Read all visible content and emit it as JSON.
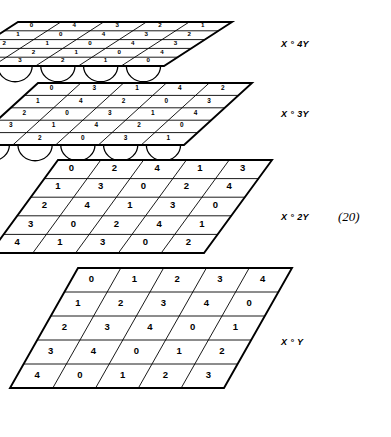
{
  "figure": {
    "equation_number": "(20)",
    "modulus": 5,
    "grid_size": 5,
    "layers": [
      {
        "label": "X ° 4Y",
        "label_id": "x-4y",
        "multiplier": 4,
        "has_support_arcs": true,
        "support_arc_count": 5,
        "rows": [
          [
            0,
            4,
            3,
            2,
            1
          ],
          [
            1,
            0,
            4,
            3,
            2
          ],
          [
            2,
            1,
            0,
            4,
            3
          ],
          [
            3,
            2,
            1,
            0,
            4
          ],
          [
            4,
            3,
            2,
            1,
            0
          ]
        ]
      },
      {
        "label": "X ° 3Y",
        "label_id": "x-3y",
        "multiplier": 3,
        "has_support_arcs": true,
        "support_arc_count": 5,
        "rows": [
          [
            0,
            3,
            1,
            4,
            2
          ],
          [
            1,
            4,
            2,
            0,
            3
          ],
          [
            2,
            0,
            3,
            1,
            4
          ],
          [
            3,
            1,
            4,
            2,
            0
          ],
          [
            4,
            2,
            0,
            3,
            1
          ]
        ]
      },
      {
        "label": "X ° 2Y",
        "label_id": "x-2y",
        "multiplier": 2,
        "has_support_arcs": false,
        "support_arc_count": 0,
        "rows": [
          [
            0,
            2,
            4,
            1,
            3
          ],
          [
            1,
            3,
            0,
            2,
            4
          ],
          [
            2,
            4,
            1,
            3,
            0
          ],
          [
            3,
            0,
            2,
            4,
            1
          ],
          [
            4,
            1,
            3,
            0,
            2
          ]
        ]
      },
      {
        "label": "X ° Y",
        "label_id": "x-y",
        "multiplier": 1,
        "has_support_arcs": false,
        "support_arc_count": 0,
        "rows": [
          [
            0,
            1,
            2,
            3,
            4
          ],
          [
            1,
            2,
            3,
            4,
            0
          ],
          [
            2,
            3,
            4,
            0,
            1
          ],
          [
            3,
            4,
            0,
            1,
            2
          ],
          [
            4,
            0,
            1,
            2,
            3
          ]
        ]
      }
    ]
  },
  "geometry": {
    "layer_boxes": [
      {
        "right": 232,
        "top": 22,
        "width": 214,
        "height": 44,
        "skew": 68,
        "label_x": 281,
        "label_y": 39
      },
      {
        "right": 252,
        "top": 83,
        "width": 214,
        "height": 62,
        "skew": 68,
        "label_x": 281,
        "label_y": 109
      },
      {
        "right": 272,
        "top": 160,
        "width": 214,
        "height": 93,
        "skew": 68,
        "label_x": 281,
        "label_y": 212
      },
      {
        "right": 292,
        "top": 268,
        "width": 214,
        "height": 120,
        "skew": 68,
        "label_x": 281,
        "label_y": 337
      }
    ]
  },
  "style": {
    "stroke": "#000000",
    "fill": "#ffffff",
    "edge_width": 1.9,
    "grid_width": 0.9
  }
}
